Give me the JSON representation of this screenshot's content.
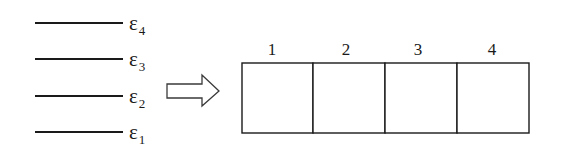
{
  "diagram": {
    "energy_levels": [
      {
        "symbol": "ε",
        "subscript": "4"
      },
      {
        "symbol": "ε",
        "subscript": "3"
      },
      {
        "symbol": "ε",
        "subscript": "2"
      },
      {
        "symbol": "ε",
        "subscript": "1"
      }
    ],
    "arrow": {
      "direction": "right",
      "icon": "hollow-right-arrow-icon"
    },
    "boxes": [
      {
        "label": "1"
      },
      {
        "label": "2"
      },
      {
        "label": "3"
      },
      {
        "label": "4"
      }
    ],
    "colors": {
      "stroke": "#1a1a1a",
      "background": "#ffffff"
    }
  }
}
